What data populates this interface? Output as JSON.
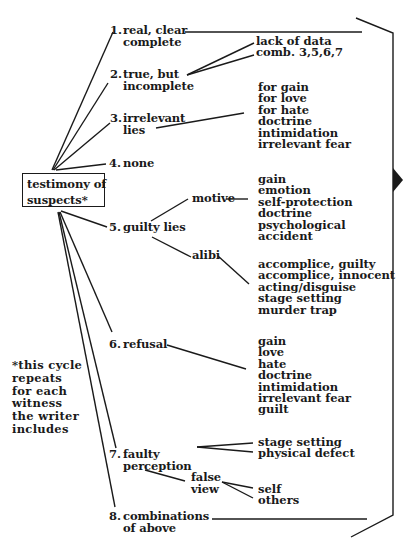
{
  "root": {
    "label_line1": "testimony of",
    "label_line2": "suspects*"
  },
  "categories": [
    {
      "num": "1.",
      "line1": "real, clear",
      "line2": "complete"
    },
    {
      "num": "2.",
      "line1": "true, but",
      "line2": "incomplete",
      "subitems": [
        "lack of data",
        "comb. 3,5,6,7"
      ]
    },
    {
      "num": "3.",
      "line1": "irrelevant",
      "line2": "lies",
      "subitems": [
        "for gain",
        "for love",
        "for hate",
        "doctrine",
        "intimidation",
        "irrelevant fear"
      ]
    },
    {
      "num": "4.",
      "line1": "none"
    },
    {
      "num": "5.",
      "line1": "guilty lies",
      "branches": [
        {
          "label": "motive",
          "subitems": [
            "gain",
            "emotion",
            "self-protection",
            "doctrine",
            "psychological",
            "accident"
          ]
        },
        {
          "label": "alibi",
          "subitems": [
            "accomplice, guilty",
            "accomplice, innocent",
            "acting/disguise",
            "stage setting",
            "murder trap"
          ]
        }
      ]
    },
    {
      "num": "6.",
      "line1": "refusal",
      "subitems": [
        "gain",
        "love",
        "hate",
        "doctrine",
        "intimidation",
        "irrelevant fear",
        "guilt"
      ]
    },
    {
      "num": "7.",
      "line1": "faulty",
      "line2": "perception",
      "subitems": [
        "stage setting",
        "physical defect"
      ],
      "branch": {
        "label_line1": "false",
        "label_line2": "view",
        "subitems": [
          "self",
          "others"
        ]
      }
    },
    {
      "num": "8.",
      "line1": "combinations",
      "line2": "of above"
    }
  ],
  "footnote": [
    "*this cycle",
    "repeats",
    "for each",
    "witness",
    "the writer",
    "includes"
  ],
  "colors": {
    "ink": "#1a1a1a",
    "background": "#ffffff"
  }
}
